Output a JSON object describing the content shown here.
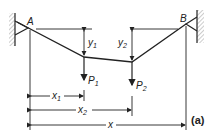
{
  "diagram": {
    "figure_tag": "(a)",
    "supports": {
      "left": "A",
      "right": "B"
    },
    "loads": [
      {
        "label": "P",
        "sub": "1"
      },
      {
        "label": "P",
        "sub": "2"
      }
    ],
    "deflections": [
      {
        "label": "y",
        "sub": "1"
      },
      {
        "label": "y",
        "sub": "2"
      }
    ],
    "dimensions": [
      {
        "label": "x",
        "sub": "1"
      },
      {
        "label": "x",
        "sub": "2"
      },
      {
        "label": "x",
        "sub": ""
      }
    ],
    "colors": {
      "line": "#222222",
      "hatch": "#888888"
    }
  }
}
